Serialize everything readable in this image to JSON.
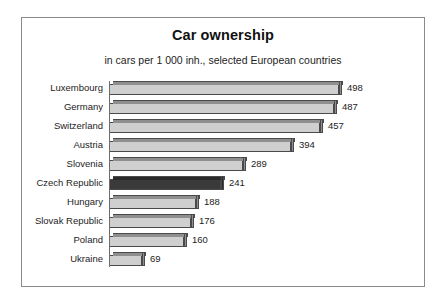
{
  "chart_data": {
    "type": "bar",
    "orientation": "horizontal",
    "title": "Car ownership",
    "subtitle": "in cars per 1 000 inh., selected European countries",
    "xlabel": "",
    "ylabel": "",
    "xlim": [
      0,
      498
    ],
    "grid": false,
    "legend": "none",
    "value_labels": true,
    "categories": [
      "Luxembourg",
      "Germany",
      "Switzerland",
      "Austria",
      "Slovenia",
      "Czech Republic",
      "Hungary",
      "Slovak Republic",
      "Poland",
      "Ukraine"
    ],
    "values": [
      498,
      487,
      457,
      394,
      289,
      241,
      188,
      176,
      160,
      69
    ],
    "highlight_category": "Czech Republic",
    "colors": {
      "bar_face": "#cfcfcf",
      "bar_shade": "#8f8f8f",
      "bar_outline": "#4a4a4a",
      "highlight_face": "#3a3a3a",
      "highlight_shade": "#2a2a2a",
      "frame_border": "#8a8a8a",
      "background": "#ffffff",
      "text": "#1d1d1d"
    }
  }
}
